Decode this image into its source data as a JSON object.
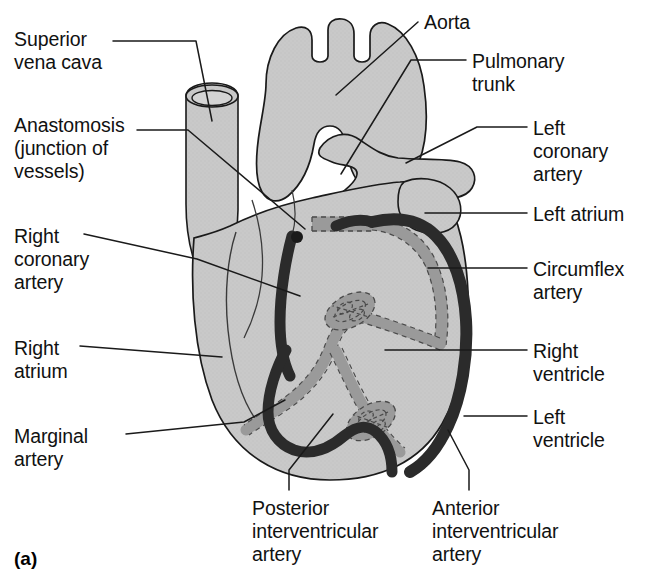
{
  "figure": {
    "panel_letter": "(a)",
    "colors": {
      "myocardium_fill": "#c8c8c8",
      "outline": "#1a1a1a",
      "dark_artery": "#2b2b2b",
      "light_artery": "#9a9a9a",
      "background": "#ffffff",
      "leader_line": "#1a1a1a"
    }
  },
  "labels": [
    {
      "id": "superior-vena-cava",
      "text": "Superior\nvena cava",
      "side": "left",
      "x": 14,
      "y": 28
    },
    {
      "id": "anastomosis",
      "text": "Anastomosis\n(junction of\nvessels)",
      "side": "left",
      "x": 14,
      "y": 114
    },
    {
      "id": "right-coronary-artery",
      "text": "Right\ncoronary\nartery",
      "side": "left",
      "x": 14,
      "y": 225
    },
    {
      "id": "right-atrium",
      "text": "Right\natrium",
      "side": "left",
      "x": 14,
      "y": 337
    },
    {
      "id": "marginal-artery",
      "text": "Marginal\nartery",
      "side": "left",
      "x": 14,
      "y": 425
    },
    {
      "id": "aorta",
      "text": "Aorta",
      "side": "right",
      "x": 424,
      "y": 11
    },
    {
      "id": "pulmonary-trunk",
      "text": "Pulmonary\ntrunk",
      "side": "right",
      "x": 472,
      "y": 50
    },
    {
      "id": "left-coronary-artery",
      "text": "Left\ncoronary\nartery",
      "side": "right",
      "x": 533,
      "y": 117
    },
    {
      "id": "left-atrium",
      "text": "Left atrium",
      "side": "right",
      "x": 533,
      "y": 203
    },
    {
      "id": "circumflex-artery",
      "text": "Circumflex\nartery",
      "side": "right",
      "x": 533,
      "y": 258
    },
    {
      "id": "right-ventricle",
      "text": "Right\nventricle",
      "side": "right",
      "x": 533,
      "y": 340
    },
    {
      "id": "left-ventricle",
      "text": "Left\nventricle",
      "side": "right",
      "x": 533,
      "y": 406
    },
    {
      "id": "posterior-interventricular-artery",
      "text": "Posterior\ninterventricular\nartery",
      "side": "bottom",
      "x": 252,
      "y": 497
    },
    {
      "id": "anterior-interventricular-artery",
      "text": "Anterior\ninterventricular\nartery",
      "side": "bottom",
      "x": 432,
      "y": 497
    }
  ],
  "leader_lines": [
    {
      "id": "leader-superior-vena-cava",
      "points": "113,41 196,41 212,121"
    },
    {
      "id": "leader-anastomosis",
      "points": "137,130 188,130 305,229"
    },
    {
      "id": "leader-right-coronary-artery",
      "points": "84,234 197,259 300,296"
    },
    {
      "id": "leader-right-atrium",
      "points": "80,346 222,357"
    },
    {
      "id": "leader-marginal-artery",
      "points": "126,434 244,422 285,400"
    },
    {
      "id": "leader-aorta",
      "points": "418,22 336,95"
    },
    {
      "id": "leader-pulmonary-trunk",
      "points": "466,60 411,60 341,174"
    },
    {
      "id": "leader-left-coronary-artery",
      "points": "527,127 477,127 406,163"
    },
    {
      "id": "leader-left-atrium",
      "points": "527,213 425,213"
    },
    {
      "id": "leader-circumflex-artery",
      "points": "527,268 428,268"
    },
    {
      "id": "leader-right-ventricle",
      "points": "527,350 385,350"
    },
    {
      "id": "leader-left-ventricle",
      "points": "527,416 464,416"
    },
    {
      "id": "leader-posterior-interventricular",
      "points": "289,490 289,470 333,414"
    },
    {
      "id": "leader-anterior-interventricular",
      "points": "469,490 469,470 448,430"
    }
  ],
  "structures": [
    {
      "id": "aorta",
      "type": "vessel",
      "shade": "myocardium"
    },
    {
      "id": "aortic-arch-branches",
      "type": "vessel",
      "count": 3,
      "shade": "myocardium"
    },
    {
      "id": "superior-vena-cava",
      "type": "vessel-tube",
      "shade": "myocardium"
    },
    {
      "id": "pulmonary-trunk",
      "type": "vessel",
      "shade": "myocardium"
    },
    {
      "id": "right-atrium",
      "type": "chamber",
      "shade": "myocardium"
    },
    {
      "id": "left-atrium",
      "type": "chamber",
      "shade": "myocardium"
    },
    {
      "id": "right-ventricle",
      "type": "chamber",
      "shade": "myocardium"
    },
    {
      "id": "left-ventricle",
      "type": "chamber",
      "shade": "myocardium"
    },
    {
      "id": "right-coronary-artery",
      "type": "artery",
      "shade": "dark"
    },
    {
      "id": "marginal-artery",
      "type": "artery",
      "shade": "dark"
    },
    {
      "id": "anterior-interventricular-artery",
      "type": "artery",
      "shade": "dark"
    },
    {
      "id": "left-coronary-artery",
      "type": "artery",
      "shade": "light-dashed"
    },
    {
      "id": "circumflex-artery",
      "type": "artery",
      "shade": "light-dashed"
    },
    {
      "id": "posterior-interventricular-artery",
      "type": "artery",
      "shade": "light-dashed"
    },
    {
      "id": "anastomosis-upper",
      "type": "anastomosis-mesh",
      "shade": "light-dashed"
    },
    {
      "id": "anastomosis-lower",
      "type": "anastomosis-mesh",
      "shade": "light-dashed"
    }
  ]
}
